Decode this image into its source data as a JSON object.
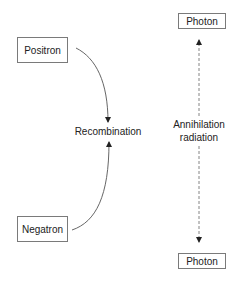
{
  "diagram": {
    "nodes": {
      "positron": {
        "label": "Positron"
      },
      "negatron": {
        "label": "Negatron"
      },
      "photon_top": {
        "label": "Photon"
      },
      "photon_bottom": {
        "label": "Photon"
      }
    },
    "labels": {
      "recombination": "Recombination",
      "annihilation_line1": "Annihilation",
      "annihilation_line2": "radiation"
    },
    "edges": [
      {
        "from": "positron",
        "to": "recombination",
        "style": "solid-curve",
        "arrow": "end"
      },
      {
        "from": "negatron",
        "to": "recombination",
        "style": "solid-curve",
        "arrow": "end"
      },
      {
        "from": "annihilation",
        "to": "photon_top",
        "style": "dashed",
        "arrow": "end"
      },
      {
        "from": "annihilation",
        "to": "photon_bottom",
        "style": "dashed",
        "arrow": "end"
      }
    ],
    "colors": {
      "line": "#444444",
      "box_border": "#7a7a7a",
      "text": "#222222"
    }
  }
}
